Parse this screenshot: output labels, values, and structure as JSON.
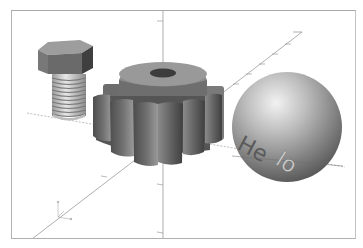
{
  "viewer": {
    "type": "3d-viewport",
    "background": "#ffffff",
    "frame_color": "#b0b0b0",
    "axes_color": "#8a8a8a"
  },
  "objects": [
    {
      "name": "hex-bolt",
      "color": "#8a8a8a"
    },
    {
      "name": "spur-gear",
      "teeth_visible": 10,
      "color": "#7e7e7e"
    },
    {
      "name": "sphere",
      "color": "#9a9a9a",
      "engraved_text": "Hello",
      "text_parts": [
        "He",
        "l",
        "lo"
      ]
    }
  ],
  "sphere_label": {
    "left": "He",
    "right": "lo"
  },
  "axes_indicator": {
    "labels": [
      "z",
      "y",
      "x"
    ]
  }
}
